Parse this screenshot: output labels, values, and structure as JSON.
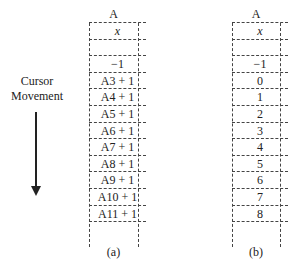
{
  "cursor": {
    "line1": "Cursor",
    "line2": "Movement",
    "direction": "down"
  },
  "columns": [
    {
      "id": "a",
      "header": "A",
      "caption": "(a)",
      "cells": [
        "x",
        "",
        "−1",
        "A3 + 1",
        "A4 + 1",
        "A5 + 1",
        "A6 + 1",
        "A7 + 1",
        "A8 + 1",
        "A9 + 1",
        "A10 + 1",
        "A11 + 1"
      ]
    },
    {
      "id": "b",
      "header": "A",
      "caption": "(b)",
      "cells": [
        "x",
        "",
        "−1",
        "0",
        "1",
        "2",
        "3",
        "4",
        "5",
        "6",
        "7",
        "8"
      ]
    }
  ]
}
